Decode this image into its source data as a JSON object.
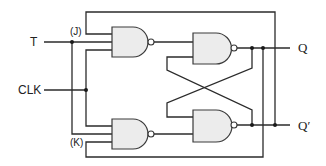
{
  "diagram": {
    "inputs": {
      "t": "T",
      "clk": "CLK"
    },
    "internal_labels": {
      "j": "(J)",
      "k": "(K)"
    },
    "outputs": {
      "q": "Q",
      "q_bar": "Q′"
    },
    "gates": [
      {
        "id": "nand-j",
        "type": "NAND",
        "inputs": 3
      },
      {
        "id": "nand-k",
        "type": "NAND",
        "inputs": 3
      },
      {
        "id": "nand-q",
        "type": "NAND",
        "inputs": 2
      },
      {
        "id": "nand-qbar",
        "type": "NAND",
        "inputs": 2
      }
    ],
    "colors": {
      "wire": "#2b2b2b",
      "gate_fill": "#ececec",
      "background": "#ffffff"
    }
  }
}
